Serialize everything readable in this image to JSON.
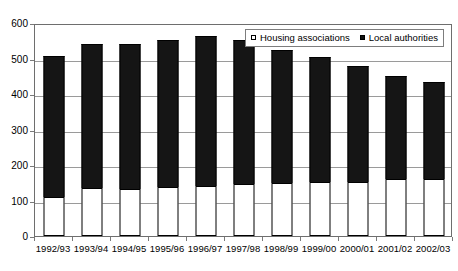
{
  "chart_data": {
    "type": "bar",
    "stacked": true,
    "title": "",
    "subtitle": "",
    "xlabel": "",
    "ylabel": "",
    "ylim": [
      0,
      600
    ],
    "ytick_step": 100,
    "yticks": [
      "0",
      "100",
      "200",
      "300",
      "400",
      "500",
      "600"
    ],
    "grid": true,
    "legend_position": "inside-top-right",
    "categories": [
      "1992/93",
      "1993/94",
      "1994/95",
      "1995/96",
      "1996/97",
      "1997/98",
      "1998/99",
      "1999/00",
      "2000/01",
      "2001/02",
      "2002/03"
    ],
    "series": [
      {
        "name": "Housing associations",
        "color": "#ffffff",
        "values": [
          110,
          135,
          133,
          138,
          141,
          147,
          150,
          151,
          153,
          161,
          162
        ]
      },
      {
        "name": "Local authorities",
        "color": "#111111",
        "values": [
          398,
          405,
          407,
          414,
          423,
          404,
          375,
          354,
          327,
          290,
          272
        ]
      }
    ],
    "totals": [
      508,
      540,
      540,
      552,
      564,
      551,
      525,
      505,
      480,
      451,
      434
    ]
  },
  "legend": {
    "entries": [
      {
        "label": "Housing associations",
        "swatch": "open-square-icon"
      },
      {
        "label": "Local authorities",
        "swatch": "filled-square-icon"
      }
    ]
  }
}
